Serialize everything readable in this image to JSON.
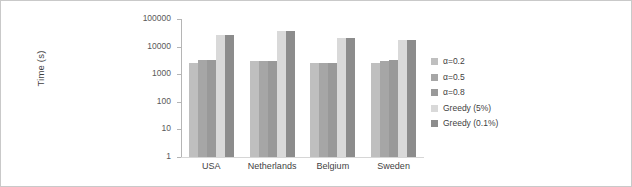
{
  "chart_data": {
    "type": "bar",
    "title": "",
    "xlabel": "",
    "ylabel": "Time (s)",
    "yscale": "log",
    "ylim": [
      1,
      100000
    ],
    "yticks": [
      100000,
      10000,
      1000,
      100,
      10,
      1
    ],
    "ytick_labels": [
      "100000",
      "10000",
      "1000",
      "100",
      "10",
      "1"
    ],
    "grid": false,
    "legend_position": "right",
    "categories": [
      "USA",
      "Netherlands",
      "Belgium",
      "Sweden"
    ],
    "series": [
      {
        "name": "α=0.2",
        "color": "#bfbfbf",
        "values": [
          2500,
          3000,
          2500,
          2600
        ]
      },
      {
        "name": "α=0.5",
        "color": "#a6a6a6",
        "values": [
          3200,
          3000,
          2500,
          3000
        ]
      },
      {
        "name": "α=0.8",
        "color": "#999999",
        "values": [
          3200,
          3000,
          2500,
          3400
        ]
      },
      {
        "name": "Greedy (5%)",
        "color": "#d9d9d9",
        "values": [
          26000,
          36000,
          21000,
          17000
        ]
      },
      {
        "name": "Greedy (0.1%)",
        "color": "#8c8c8c",
        "values": [
          26000,
          36000,
          21000,
          17000
        ]
      }
    ]
  },
  "legend": {
    "items": [
      {
        "label": "α=0.2",
        "color": "#bfbfbf"
      },
      {
        "label": "α=0.5",
        "color": "#a6a6a6"
      },
      {
        "label": "α=0.8",
        "color": "#999999"
      },
      {
        "label": "Greedy (5%)",
        "color": "#d9d9d9"
      },
      {
        "label": "Greedy (0.1%)",
        "color": "#8c8c8c"
      }
    ]
  }
}
